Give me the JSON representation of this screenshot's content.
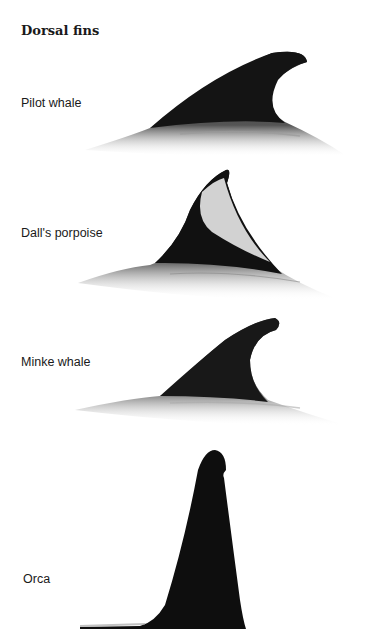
{
  "title": "Dorsal fins",
  "species": [
    {
      "label": "Pilot whale"
    },
    {
      "label": "Dall's porpoise"
    },
    {
      "label": "Minke whale"
    },
    {
      "label": "Orca"
    }
  ],
  "colors": {
    "fin": "#111111",
    "body": "#3a3a3a",
    "dall_patch": "#d0d0d0",
    "background": "#ffffff"
  }
}
